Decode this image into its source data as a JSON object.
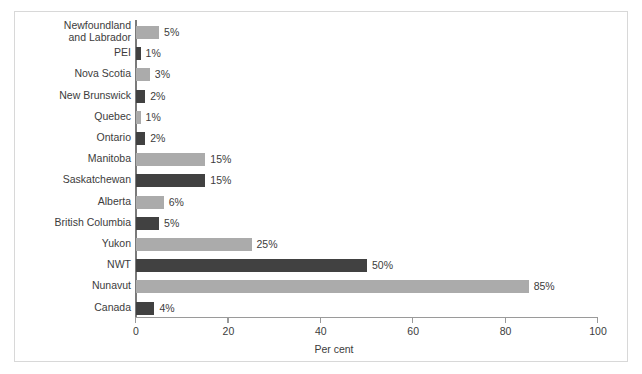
{
  "chart_data": {
    "type": "bar",
    "orientation": "horizontal",
    "title": "",
    "subtitle": "",
    "xlabel": "Per cent",
    "ylabel": "",
    "xlim": [
      0,
      100
    ],
    "xticks": [
      0,
      20,
      40,
      60,
      80,
      100
    ],
    "xtick_labels": [
      "0",
      "20",
      "40",
      "60",
      "80",
      "100"
    ],
    "grid": false,
    "legend": false,
    "categories": [
      "Newfoundland\nand Labrador",
      "PEI",
      "Nova Scotia",
      "New Brunswick",
      "Quebec",
      "Ontario",
      "Manitoba",
      "Saskatchewan",
      "Alberta",
      "British Columbia",
      "Yukon",
      "NWT",
      "Nunavut",
      "Canada"
    ],
    "values": [
      5,
      1,
      3,
      2,
      1,
      2,
      15,
      15,
      6,
      5,
      25,
      50,
      85,
      4
    ],
    "value_labels": [
      "5%",
      "1%",
      "3%",
      "2%",
      "1%",
      "2%",
      "15%",
      "15%",
      "6%",
      "5%",
      "25%",
      "50%",
      "85%",
      "4%"
    ],
    "bar_shades": [
      "light",
      "dark",
      "light",
      "dark",
      "light",
      "dark",
      "light",
      "dark",
      "light",
      "dark",
      "light",
      "dark",
      "light",
      "dark"
    ],
    "colors": {
      "light_bar": "#ababab",
      "dark_bar": "#414141",
      "axis": "#9a9a9a",
      "text": "#3c3c3c",
      "background": "#ffffff",
      "frame": "#d8d8d8"
    }
  }
}
